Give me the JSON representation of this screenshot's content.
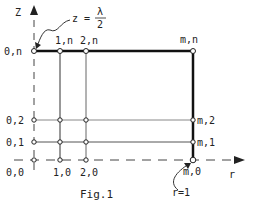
{
  "figure": {
    "caption": "Fig.1",
    "axes": {
      "z_label": "Z",
      "r_label": "r"
    },
    "annotations": {
      "top": "z = λ/2",
      "top_lhs": "z =",
      "top_num": "λ",
      "top_den": "2",
      "right": "r=1"
    },
    "nodes": {
      "0n": "0,n",
      "1n": "1,n",
      "2n": "2,n",
      "mn": "m,n",
      "02": "0,2",
      "01": "0,1",
      "00": "0,0",
      "10": "1,0",
      "20": "2,0",
      "m2": "m,2",
      "m1": "m,1",
      "m0": "m,0"
    }
  }
}
